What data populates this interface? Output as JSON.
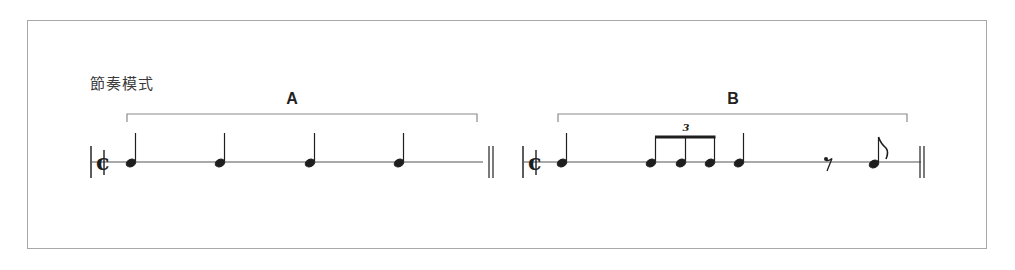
{
  "title": "節奏模式",
  "sections": [
    {
      "label": "A",
      "time_signature": "common-time",
      "notes": [
        "quarter",
        "quarter",
        "quarter",
        "quarter"
      ],
      "end_barline": "double"
    },
    {
      "label": "B",
      "time_signature": "common-time",
      "notes": [
        "quarter",
        "triplet-eighth",
        "triplet-eighth",
        "triplet-eighth",
        "quarter",
        "eighth-rest",
        "eighth"
      ],
      "tuplet_label": "3",
      "end_barline": "double"
    }
  ],
  "colors": {
    "ink": "#1e1e1e",
    "frame": "#a8a8a8",
    "bracket": "#8a8a8a"
  }
}
